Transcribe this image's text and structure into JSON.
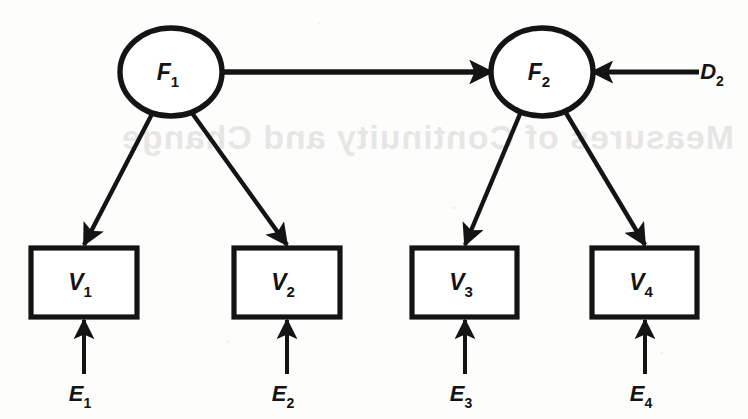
{
  "figure": {
    "type": "path-diagram",
    "background_color": "#fdfdfc",
    "ink_color": "#141414",
    "bleed_through_text": "Measures of Continuity and Change"
  },
  "nodes": {
    "latent": [
      {
        "id": "F1",
        "base": "F",
        "subscript": "1",
        "shape": "ellipse",
        "cx": 171,
        "cy": 72,
        "rx": 51,
        "ry": 44
      },
      {
        "id": "F2",
        "base": "F",
        "subscript": "2",
        "shape": "ellipse",
        "cx": 542,
        "cy": 72,
        "rx": 51,
        "ry": 44
      }
    ],
    "measured": [
      {
        "id": "V1",
        "base": "V",
        "subscript": "1",
        "shape": "rect",
        "x": 31,
        "y": 248,
        "width": 106,
        "height": 69
      },
      {
        "id": "V2",
        "base": "V",
        "subscript": "2",
        "shape": "rect",
        "x": 234,
        "y": 248,
        "width": 106,
        "height": 69
      },
      {
        "id": "V3",
        "base": "V",
        "subscript": "3",
        "shape": "rect",
        "x": 412,
        "y": 248,
        "width": 105,
        "height": 69
      },
      {
        "id": "V4",
        "base": "V",
        "subscript": "4",
        "shape": "rect",
        "x": 592,
        "y": 248,
        "width": 105,
        "height": 69
      }
    ],
    "residuals": [
      {
        "id": "E1",
        "base": "E",
        "subscript": "1",
        "shape": "label",
        "x": 84,
        "y": 396
      },
      {
        "id": "E2",
        "base": "E",
        "subscript": "2",
        "shape": "label",
        "x": 287,
        "y": 396
      },
      {
        "id": "E3",
        "base": "E",
        "subscript": "3",
        "shape": "label",
        "x": 465,
        "y": 396
      },
      {
        "id": "E4",
        "base": "E",
        "subscript": "4",
        "shape": "label",
        "x": 645,
        "y": 396
      }
    ],
    "disturbance": [
      {
        "id": "D2",
        "base": "D",
        "subscript": "2",
        "shape": "label",
        "x": 716,
        "y": 72
      }
    ]
  },
  "paths": [
    {
      "id": "F1-to-F2",
      "from": "F1",
      "to": "F2",
      "kind": "structural",
      "direction": "horizontal-right"
    },
    {
      "id": "D2-to-F2",
      "from": "D2",
      "to": "F2",
      "kind": "disturbance",
      "direction": "horizontal-left"
    },
    {
      "id": "F1-to-V1",
      "from": "F1",
      "to": "V1",
      "kind": "loading",
      "direction": "diagonal-down-left"
    },
    {
      "id": "F1-to-V2",
      "from": "F1",
      "to": "V2",
      "kind": "loading",
      "direction": "diagonal-down-right"
    },
    {
      "id": "F2-to-V3",
      "from": "F2",
      "to": "V3",
      "kind": "loading",
      "direction": "diagonal-down-left"
    },
    {
      "id": "F2-to-V4",
      "from": "F2",
      "to": "V4",
      "kind": "loading",
      "direction": "diagonal-down-right"
    },
    {
      "id": "E1-to-V1",
      "from": "E1",
      "to": "V1",
      "kind": "error",
      "direction": "vertical-up"
    },
    {
      "id": "E2-to-V2",
      "from": "E2",
      "to": "V2",
      "kind": "error",
      "direction": "vertical-up"
    },
    {
      "id": "E3-to-V3",
      "from": "E3",
      "to": "V3",
      "kind": "error",
      "direction": "vertical-up"
    },
    {
      "id": "E4-to-V4",
      "from": "E4",
      "to": "V4",
      "kind": "error",
      "direction": "vertical-up"
    }
  ]
}
